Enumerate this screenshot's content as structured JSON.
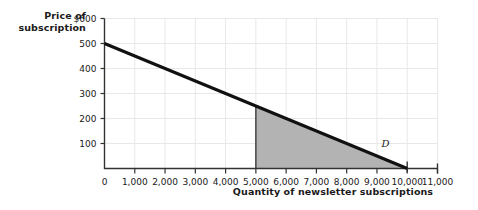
{
  "chart_data": {
    "type": "line",
    "title": "",
    "xlabel": "Quantity of newsletter subscriptions",
    "ylabel": "Price of subscription",
    "xlim": [
      0,
      11000
    ],
    "ylim": [
      0,
      600
    ],
    "grid": true,
    "legend": "none",
    "xticks": [
      "0",
      "1,000",
      "2,000",
      "3,000",
      "4,000",
      "5,000",
      "6,000",
      "7,000",
      "8,000",
      "9,000",
      "10,000",
      "11,000"
    ],
    "xtick_values": [
      0,
      1000,
      2000,
      3000,
      4000,
      5000,
      6000,
      7000,
      8000,
      9000,
      10000,
      11000
    ],
    "yticks": [
      "$600",
      "500",
      "400",
      "300",
      "200",
      "100"
    ],
    "ytick_values": [
      600,
      500,
      400,
      300,
      200,
      100
    ],
    "series": [
      {
        "name": "D",
        "label": "D",
        "type": "line",
        "color": "#111111",
        "x": [
          0,
          10000
        ],
        "values": [
          500,
          0
        ],
        "annotation": "D",
        "annotation_x": 9250,
        "annotation_y": 75
      }
    ],
    "shaded_regions": [
      {
        "name": "shaded-triangle",
        "color": "#b3b3b3",
        "x_range": [
          5000,
          10000
        ],
        "y_top_at_x_start": 250,
        "y_top_at_x_end": 0,
        "vertices": [
          [
            5000,
            0
          ],
          [
            5000,
            250
          ],
          [
            10000,
            0
          ]
        ]
      }
    ],
    "axis_color": "#333333",
    "grid_color": "#e8e8e8"
  },
  "axis": {
    "y_title_line1": "Price of",
    "y_title_line2": "subscription",
    "x_title": "Quantity of newsletter subscriptions"
  }
}
